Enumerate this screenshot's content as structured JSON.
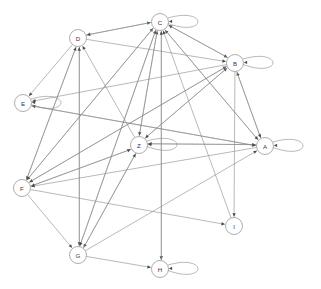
{
  "diagram": {
    "type": "directed-graph",
    "width": 321,
    "height": 289,
    "background_color": "#ffffff",
    "edge_color": "#8a8a8a",
    "node_fill_color": "#ffffff",
    "node_stroke_color": "#8a8a8a",
    "label_color": "#3a3a3a",
    "arrow_color": "#4a4a4a",
    "node_radius": 8.5
  },
  "nodes": [
    {
      "id": "C",
      "label": "C",
      "x": 160,
      "y": 22,
      "self_loop": true,
      "loop_dir": "right"
    },
    {
      "id": "D",
      "label": "D",
      "x": 78,
      "y": 38,
      "self_loop": false,
      "loop_dir": "none"
    },
    {
      "id": "B",
      "label": "B",
      "x": 235,
      "y": 63,
      "self_loop": true,
      "loop_dir": "right"
    },
    {
      "id": "E",
      "label": "E",
      "x": 23,
      "y": 103,
      "self_loop": true,
      "loop_dir": "right"
    },
    {
      "id": "Z",
      "label": "Z",
      "x": 139,
      "y": 145,
      "self_loop": true,
      "loop_dir": "right"
    },
    {
      "id": "A",
      "label": "A",
      "x": 265,
      "y": 146,
      "self_loop": true,
      "loop_dir": "right"
    },
    {
      "id": "F",
      "label": "F",
      "x": 22,
      "y": 188,
      "self_loop": false,
      "loop_dir": "none"
    },
    {
      "id": "I",
      "label": "I",
      "x": 234,
      "y": 226,
      "self_loop": false,
      "loop_dir": "none"
    },
    {
      "id": "G",
      "label": "G",
      "x": 78,
      "y": 255,
      "self_loop": false,
      "loop_dir": "none"
    },
    {
      "id": "H",
      "label": "H",
      "x": 160,
      "y": 269,
      "self_loop": true,
      "loop_dir": "right"
    }
  ],
  "edges": [
    {
      "from": "C",
      "to": "C"
    },
    {
      "from": "B",
      "to": "B"
    },
    {
      "from": "E",
      "to": "E"
    },
    {
      "from": "Z",
      "to": "Z"
    },
    {
      "from": "A",
      "to": "A"
    },
    {
      "from": "H",
      "to": "H"
    },
    {
      "from": "D",
      "to": "C"
    },
    {
      "from": "C",
      "to": "D"
    },
    {
      "from": "C",
      "to": "B"
    },
    {
      "from": "D",
      "to": "B"
    },
    {
      "from": "D",
      "to": "E"
    },
    {
      "from": "D",
      "to": "G"
    },
    {
      "from": "D",
      "to": "F"
    },
    {
      "from": "Z",
      "to": "C"
    },
    {
      "from": "Z",
      "to": "D"
    },
    {
      "from": "Z",
      "to": "B"
    },
    {
      "from": "Z",
      "to": "A"
    },
    {
      "from": "Z",
      "to": "F"
    },
    {
      "from": "Z",
      "to": "G"
    },
    {
      "from": "F",
      "to": "C"
    },
    {
      "from": "F",
      "to": "D"
    },
    {
      "from": "F",
      "to": "B"
    },
    {
      "from": "F",
      "to": "Z"
    },
    {
      "from": "F",
      "to": "G"
    },
    {
      "from": "F",
      "to": "I"
    },
    {
      "from": "G",
      "to": "C"
    },
    {
      "from": "G",
      "to": "D"
    },
    {
      "from": "G",
      "to": "Z"
    },
    {
      "from": "G",
      "to": "A"
    },
    {
      "from": "G",
      "to": "H"
    },
    {
      "from": "A",
      "to": "C"
    },
    {
      "from": "A",
      "to": "B"
    },
    {
      "from": "A",
      "to": "Z"
    },
    {
      "from": "A",
      "to": "E"
    },
    {
      "from": "A",
      "to": "F"
    },
    {
      "from": "B",
      "to": "C"
    },
    {
      "from": "B",
      "to": "A"
    },
    {
      "from": "B",
      "to": "Z"
    },
    {
      "from": "B",
      "to": "E"
    },
    {
      "from": "B",
      "to": "F"
    },
    {
      "from": "B",
      "to": "I"
    },
    {
      "from": "C",
      "to": "A"
    },
    {
      "from": "C",
      "to": "Z"
    },
    {
      "from": "C",
      "to": "F"
    },
    {
      "from": "C",
      "to": "H"
    },
    {
      "from": "C",
      "to": "G"
    },
    {
      "from": "E",
      "to": "A"
    },
    {
      "from": "H",
      "to": "C"
    },
    {
      "from": "I",
      "to": "C"
    }
  ]
}
